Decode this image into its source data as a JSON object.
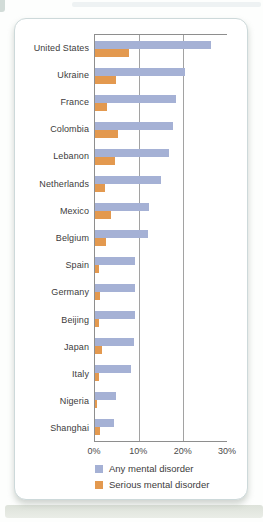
{
  "chart_data": {
    "type": "bar",
    "orientation": "horizontal",
    "categories": [
      "United States",
      "Ukraine",
      "France",
      "Colombia",
      "Lebanon",
      "Netherlands",
      "Mexico",
      "Belgium",
      "Spain",
      "Germany",
      "Beijing",
      "Japan",
      "Italy",
      "Nigeria",
      "Shanghai"
    ],
    "series": [
      {
        "name": "Any mental disorder",
        "color": "#a5b1d5",
        "values": [
          26.4,
          20.5,
          18.4,
          17.8,
          16.9,
          14.9,
          12.2,
          12.0,
          9.2,
          9.1,
          9.1,
          8.8,
          8.2,
          4.7,
          4.3
        ]
      },
      {
        "name": "Serious mental disorder",
        "color": "#e3994f",
        "values": [
          7.7,
          4.8,
          2.7,
          5.2,
          4.6,
          2.3,
          3.7,
          2.4,
          1.0,
          1.2,
          0.9,
          1.5,
          1.0,
          0.4,
          1.1
        ]
      }
    ],
    "x_ticks": [
      "0%",
      "10%",
      "20%",
      "30%"
    ],
    "xlim": [
      0,
      30
    ],
    "grid": {
      "vertical_gridlines_at_percent": [
        10,
        20
      ]
    },
    "legend_position": "bottom-left",
    "axis_line_color": "#8e8e8e"
  }
}
